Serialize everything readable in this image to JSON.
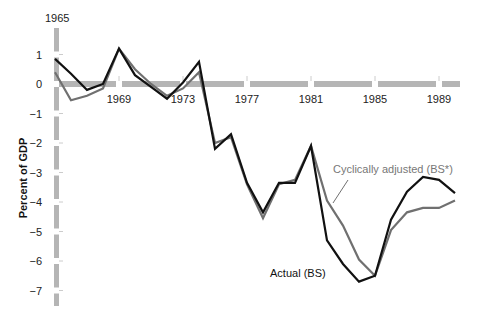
{
  "chart_data": {
    "type": "line",
    "title": "",
    "xlabel": "",
    "ylabel": "Percent of GDP",
    "ylim": [
      -7,
      1
    ],
    "xlim": [
      1965,
      1990
    ],
    "grid": false,
    "legend": "inline annotations",
    "x_ticks": [
      1965,
      1969,
      1973,
      1977,
      1981,
      1985,
      1989
    ],
    "y_ticks": [
      1,
      0,
      -1,
      -2,
      -3,
      -4,
      -5,
      -6,
      -7
    ],
    "x": [
      1965,
      1966,
      1967,
      1968,
      1969,
      1970,
      1971,
      1972,
      1973,
      1974,
      1975,
      1976,
      1977,
      1978,
      1979,
      1980,
      1981,
      1982,
      1983,
      1984,
      1985,
      1986,
      1987,
      1988,
      1989,
      1990
    ],
    "series": [
      {
        "name": "Actual (BS)",
        "color": "#111111",
        "values": [
          0.85,
          0.35,
          -0.2,
          0.0,
          1.2,
          0.3,
          -0.1,
          -0.5,
          0.05,
          0.75,
          -2.2,
          -1.7,
          -3.35,
          -4.35,
          -3.35,
          -3.35,
          -2.1,
          -5.3,
          -6.1,
          -6.7,
          -6.5,
          -4.6,
          -3.65,
          -3.15,
          -3.25,
          -3.7
        ]
      },
      {
        "name": "Cyclically adjusted (BS*)",
        "color": "#707070",
        "values": [
          0.4,
          -0.55,
          -0.4,
          -0.15,
          1.2,
          0.5,
          0.0,
          -0.4,
          -0.15,
          0.4,
          -2.0,
          -1.8,
          -3.4,
          -4.55,
          -3.4,
          -3.25,
          -2.1,
          -3.95,
          -4.8,
          -5.95,
          -6.5,
          -4.95,
          -4.35,
          -4.2,
          -4.2,
          -3.95
        ]
      }
    ],
    "annotations": [
      {
        "text": "Cyclically adjusted (BS*)",
        "series": 1
      },
      {
        "text": "Actual (BS)",
        "series": 0
      }
    ],
    "corner_label": "1965"
  },
  "labels": {
    "corner_year": "1965",
    "y_axis_title": "Percent of GDP",
    "annotation_adjusted": "Cyclically adjusted (BS*)",
    "annotation_actual": "Actual (BS)"
  }
}
